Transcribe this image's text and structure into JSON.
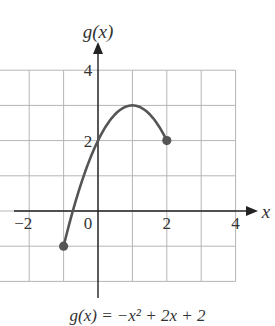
{
  "chart_data": {
    "type": "line",
    "title": "",
    "caption": "g(x) = −x² + 2x + 2",
    "xlabel": "x",
    "ylabel": "g(x)",
    "xlim": [
      -2,
      4
    ],
    "ylim": [
      -2,
      4
    ],
    "x_ticks": [
      "−2",
      "0",
      "2",
      "4"
    ],
    "x_tick_values": [
      -2,
      0,
      2,
      4
    ],
    "y_ticks": [
      "2",
      "4"
    ],
    "y_tick_values": [
      2,
      4
    ],
    "grid": true,
    "grid_step": 1,
    "series": [
      {
        "name": "g(x)",
        "function": "-x^2 + 2x + 2",
        "domain": [
          -1,
          2
        ],
        "x": [
          -1,
          -0.5,
          0,
          0.5,
          1,
          1.5,
          2
        ],
        "y": [
          -1,
          0.75,
          2,
          2.75,
          3,
          2.75,
          2
        ],
        "endpoints": [
          {
            "x": -1,
            "y": -1,
            "closed": true
          },
          {
            "x": 2,
            "y": 2,
            "closed": true
          }
        ]
      }
    ],
    "colors": {
      "curve": "#555555",
      "grid": "#b5b5b5",
      "axes": "#222222"
    }
  }
}
